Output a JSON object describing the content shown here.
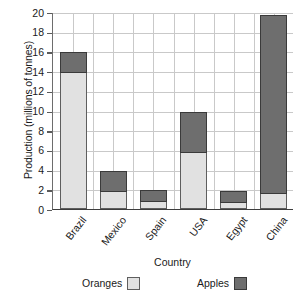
{
  "chart_data": {
    "type": "bar",
    "subtype": "stacked-vertical",
    "title": "",
    "xlabel": "Country",
    "ylabel": "Production (millions of tonnes)",
    "categories": [
      "Brazil",
      "Mexico",
      "Spain",
      "USA",
      "Egypt",
      "China"
    ],
    "series": [
      {
        "name": "Oranges",
        "color": "#e1e1e1",
        "values": [
          14,
          1.9,
          0.9,
          5.8,
          0.8,
          1.7
        ]
      },
      {
        "name": "Apples",
        "color": "#6e6e6e",
        "values": [
          1.9,
          2.0,
          1.0,
          4.0,
          1.0,
          18.0
        ]
      }
    ],
    "totals": [
      15.9,
      3.9,
      1.9,
      9.8,
      1.8,
      19.7
    ],
    "ylim": [
      0,
      20
    ],
    "ytick_labels": [
      "0",
      "2",
      "4",
      "6",
      "8",
      "10",
      "12",
      "14",
      "16",
      "18",
      "20"
    ],
    "ytick_values": [
      0,
      2,
      4,
      6,
      8,
      10,
      12,
      14,
      16,
      18,
      20
    ],
    "grid": "both",
    "legend_position": "bottom"
  },
  "legend": {
    "items": [
      {
        "label": "Oranges",
        "swatch": "light-gray-swatch"
      },
      {
        "label": "Apples",
        "swatch": "dark-gray-swatch"
      }
    ]
  },
  "colors": {
    "oranges_fill": "#e1e1e1",
    "oranges_border": "#5e5e5e",
    "apples_fill": "#6e6e6e",
    "apples_border": "#3a3a3a",
    "grid": "#c9c9c9",
    "axis": "#3d3d3d",
    "text": "#1a1a1a",
    "background": "#ffffff"
  }
}
